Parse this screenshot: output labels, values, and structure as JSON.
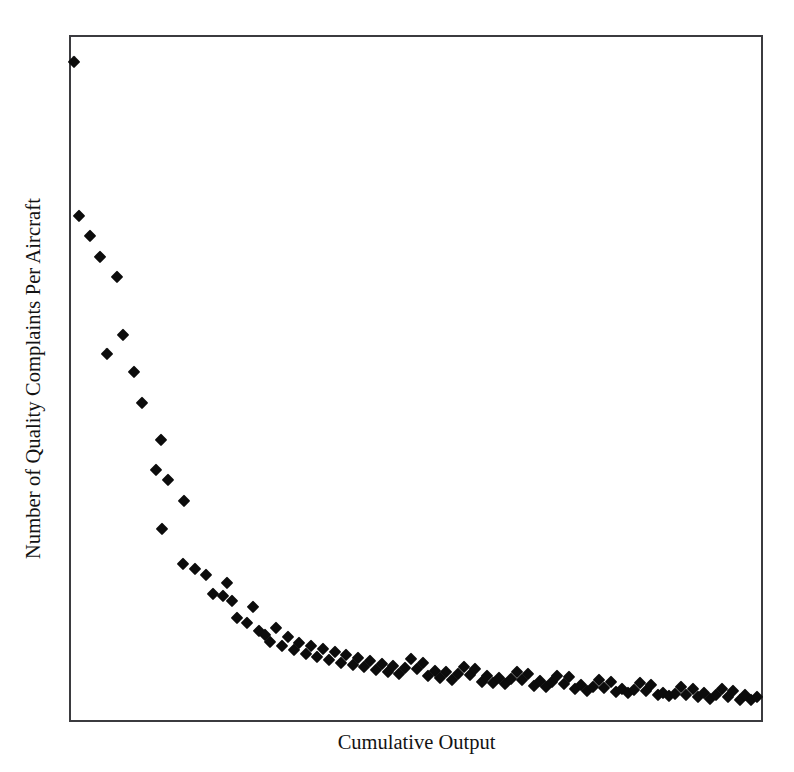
{
  "chart_data": {
    "type": "scatter",
    "title": "",
    "title_note": "title row is cut off at the top edge of the screenshot; only faint descenders are visible",
    "xlabel": "Cumulative Output",
    "ylabel": "Number of Quality Complaints Per Aircraft",
    "xlim": [
      0,
      100
    ],
    "ylim": [
      0,
      100
    ],
    "grid": false,
    "legend": null,
    "axis_tick_labels": false,
    "marker": {
      "shape": "diamond",
      "color": "#0c0c0c",
      "size_px": 13
    },
    "frame_color": "#3b3b3f",
    "background": "#ffffff",
    "series": [
      {
        "name": "Quality complaints per aircraft",
        "points": [
          [
            0.4,
            96.4
          ],
          [
            1.2,
            73.8
          ],
          [
            2.7,
            70.9
          ],
          [
            4.2,
            67.8
          ],
          [
            6.6,
            64.9
          ],
          [
            5.2,
            53.6
          ],
          [
            7.6,
            56.4
          ],
          [
            9.1,
            50.9
          ],
          [
            10.3,
            46.4
          ],
          [
            13.0,
            41.0
          ],
          [
            12.3,
            36.6
          ],
          [
            14.0,
            35.2
          ],
          [
            16.4,
            32.0
          ],
          [
            13.2,
            28.0
          ],
          [
            16.2,
            22.8
          ],
          [
            18.0,
            22.1
          ],
          [
            19.6,
            21.2
          ],
          [
            20.6,
            18.4
          ],
          [
            22.0,
            18.1
          ],
          [
            23.4,
            17.4
          ],
          [
            22.6,
            20.0
          ],
          [
            24.1,
            15.0
          ],
          [
            25.5,
            14.2
          ],
          [
            26.4,
            16.6
          ],
          [
            27.2,
            13.0
          ],
          [
            28.1,
            12.4
          ],
          [
            28.9,
            11.4
          ],
          [
            29.7,
            13.4
          ],
          [
            30.6,
            10.8
          ],
          [
            31.4,
            12.1
          ],
          [
            32.3,
            10.2
          ],
          [
            33.1,
            11.3
          ],
          [
            34.0,
            9.7
          ],
          [
            34.8,
            10.9
          ],
          [
            35.7,
            9.2
          ],
          [
            36.5,
            10.4
          ],
          [
            37.4,
            8.8
          ],
          [
            38.2,
            9.9
          ],
          [
            39.1,
            8.4
          ],
          [
            39.9,
            9.5
          ],
          [
            40.8,
            8.0
          ],
          [
            41.6,
            9.1
          ],
          [
            42.5,
            7.7
          ],
          [
            43.3,
            8.6
          ],
          [
            44.2,
            7.3
          ],
          [
            45.0,
            8.2
          ],
          [
            45.9,
            7.0
          ],
          [
            46.7,
            7.9
          ],
          [
            47.6,
            6.7
          ],
          [
            48.4,
            7.6
          ],
          [
            49.3,
            8.9
          ],
          [
            50.1,
            7.4
          ],
          [
            51.0,
            8.4
          ],
          [
            51.8,
            6.4
          ],
          [
            52.7,
            7.2
          ],
          [
            53.5,
            6.2
          ],
          [
            54.4,
            7.0
          ],
          [
            55.2,
            5.9
          ],
          [
            56.1,
            6.8
          ],
          [
            56.9,
            7.8
          ],
          [
            57.8,
            6.6
          ],
          [
            58.6,
            7.5
          ],
          [
            59.5,
            5.6
          ],
          [
            60.3,
            6.4
          ],
          [
            61.2,
            5.4
          ],
          [
            62.0,
            6.2
          ],
          [
            62.9,
            5.2
          ],
          [
            63.7,
            6.0
          ],
          [
            64.6,
            7.1
          ],
          [
            65.4,
            5.8
          ],
          [
            66.3,
            6.8
          ],
          [
            67.1,
            5.0
          ],
          [
            68.0,
            5.7
          ],
          [
            68.8,
            4.8
          ],
          [
            69.7,
            5.5
          ],
          [
            70.5,
            6.5
          ],
          [
            71.4,
            5.3
          ],
          [
            72.2,
            6.3
          ],
          [
            73.1,
            4.5
          ],
          [
            73.9,
            5.1
          ],
          [
            74.8,
            4.3
          ],
          [
            75.6,
            4.9
          ],
          [
            76.5,
            5.9
          ],
          [
            77.3,
            4.7
          ],
          [
            78.2,
            5.6
          ],
          [
            79.0,
            4.1
          ],
          [
            79.9,
            4.6
          ],
          [
            80.7,
            3.9
          ],
          [
            81.6,
            4.4
          ],
          [
            82.4,
            5.4
          ],
          [
            83.3,
            4.2
          ],
          [
            84.1,
            5.1
          ],
          [
            85.0,
            3.7
          ],
          [
            85.8,
            4.0
          ],
          [
            86.7,
            3.5
          ],
          [
            87.5,
            3.8
          ],
          [
            88.4,
            4.8
          ],
          [
            89.2,
            3.6
          ],
          [
            90.1,
            4.5
          ],
          [
            90.9,
            3.3
          ],
          [
            91.8,
            3.9
          ],
          [
            92.6,
            3.1
          ],
          [
            93.5,
            3.7
          ],
          [
            94.3,
            4.6
          ],
          [
            95.2,
            3.4
          ],
          [
            96.0,
            4.2
          ],
          [
            96.9,
            3.0
          ],
          [
            97.7,
            3.6
          ],
          [
            98.6,
            2.9
          ],
          [
            99.4,
            3.4
          ]
        ]
      }
    ]
  },
  "axes": {
    "x_title": "Cumulative Output",
    "y_title": "Number of Quality Complaints Per Aircraft"
  }
}
